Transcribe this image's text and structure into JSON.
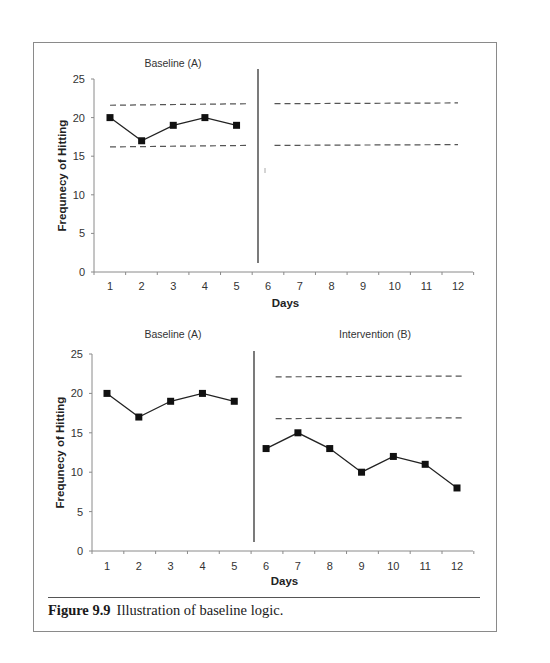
{
  "figure": {
    "label": "Figure 9.9",
    "caption": "Illustration of baseline logic."
  },
  "chart_data": [
    {
      "type": "line",
      "title": "",
      "phase_labels": [
        "Baseline (A)"
      ],
      "xlabel": "Days",
      "ylabel": "Frequnecy of Hitting",
      "categories": [
        1,
        2,
        3,
        4,
        5,
        6,
        7,
        8,
        9,
        10,
        11,
        12
      ],
      "x_tick_labels": [
        "1",
        "2",
        "3",
        "4",
        "5",
        "6",
        "7",
        "8",
        "9",
        "10",
        "11",
        "12"
      ],
      "y_tick_labels": [
        "0",
        "5",
        "10",
        "15",
        "20",
        "25"
      ],
      "ylim": [
        0,
        25
      ],
      "grid": false,
      "phase_change_after_day": 5.5,
      "series": [
        {
          "name": "Baseline (A)",
          "x": [
            1,
            2,
            3,
            4,
            5
          ],
          "values": [
            20,
            17,
            19,
            20,
            19
          ],
          "marker": "square"
        }
      ],
      "reference_lines": [
        {
          "style": "dashed",
          "x_range": [
            1,
            5.4
          ],
          "y": [
            21.6,
            21.8
          ]
        },
        {
          "style": "dashed",
          "x_range": [
            1,
            5.4
          ],
          "y": [
            16.2,
            16.4
          ]
        },
        {
          "style": "dashed",
          "x_range": [
            6.2,
            12
          ],
          "y": [
            21.8,
            21.9
          ]
        },
        {
          "style": "dashed",
          "x_range": [
            6.2,
            12
          ],
          "y": [
            16.4,
            16.5
          ]
        }
      ],
      "annotations": [
        "small tick mark near day 6, y≈13"
      ]
    },
    {
      "type": "line",
      "title": "",
      "phase_labels": [
        "Baseline (A)",
        "Intervention (B)"
      ],
      "xlabel": "Days",
      "ylabel": "Frequnecy of Hitting",
      "categories": [
        1,
        2,
        3,
        4,
        5,
        6,
        7,
        8,
        9,
        10,
        11,
        12
      ],
      "x_tick_labels": [
        "1",
        "2",
        "3",
        "4",
        "5",
        "6",
        "7",
        "8",
        "9",
        "10",
        "11",
        "12"
      ],
      "y_tick_labels": [
        "0",
        "5",
        "10",
        "15",
        "20",
        "25"
      ],
      "ylim": [
        0,
        25
      ],
      "grid": false,
      "phase_change_after_day": 5.5,
      "series": [
        {
          "name": "Baseline (A)",
          "x": [
            1,
            2,
            3,
            4,
            5
          ],
          "values": [
            20,
            17,
            19,
            20,
            19
          ],
          "marker": "square"
        },
        {
          "name": "Intervention (B)",
          "x": [
            6,
            7,
            8,
            9,
            10,
            11,
            12
          ],
          "values": [
            13,
            15,
            13,
            10,
            12,
            11,
            8
          ],
          "marker": "square"
        }
      ],
      "reference_lines": [
        {
          "style": "dashed",
          "x_range": [
            6.3,
            12.2
          ],
          "y": [
            22.1,
            22.2
          ]
        },
        {
          "style": "dashed",
          "x_range": [
            6.3,
            12.2
          ],
          "y": [
            16.8,
            16.9
          ]
        }
      ]
    }
  ]
}
